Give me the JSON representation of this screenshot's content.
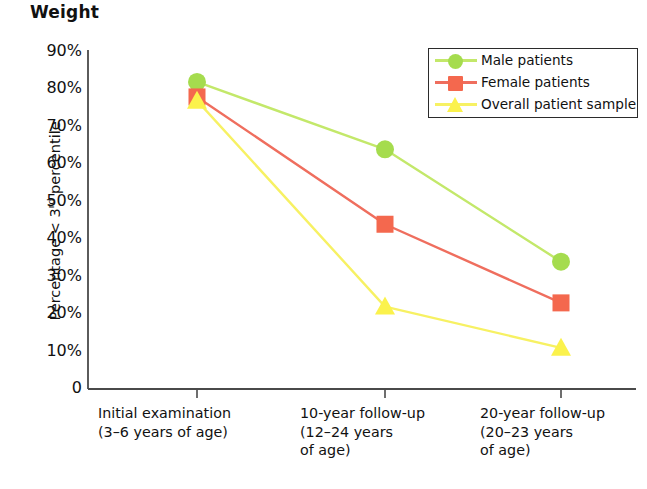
{
  "chart_data": {
    "type": "line",
    "title": "Weight",
    "xlabel": "",
    "ylabel": "Percentage < 3rd percentile",
    "ylabel_main": "Percentage < 3",
    "ylabel_sup": "rd",
    "ylabel_tail": " percentile",
    "categories": [
      "Initial examination\n(3–6 years of age)",
      "10-year follow-up\n(12–24 years\nof age)",
      "20-year follow-up\n(20–23 years\nof age)"
    ],
    "ylim": [
      0,
      90
    ],
    "ytick_labels": [
      "90%",
      "80%",
      "70%",
      "60%",
      "50%",
      "40%",
      "30%",
      "20%",
      "10%",
      "0"
    ],
    "ytick_values": [
      90,
      80,
      70,
      60,
      50,
      40,
      30,
      20,
      10,
      0
    ],
    "grid": false,
    "legend_position": "top-right",
    "series": [
      {
        "name": "Male patients",
        "marker": "circle",
        "color": "#a5dc4e",
        "line_color": "#c3e86a",
        "values": [
          82,
          64,
          34
        ]
      },
      {
        "name": "Female patients",
        "marker": "square",
        "color": "#f4684e",
        "line_color": "#ef6e5e",
        "values": [
          78,
          44,
          23
        ]
      },
      {
        "name": "Overall patient sample",
        "marker": "triangle",
        "color": "#fbf24c",
        "line_color": "#f7f163",
        "values": [
          77,
          22,
          11
        ]
      }
    ]
  },
  "axis": {
    "color": "#4a4a4a"
  }
}
